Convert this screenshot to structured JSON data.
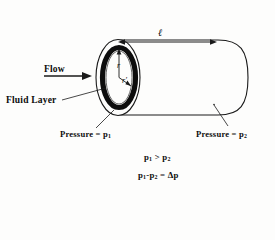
{
  "figure": {
    "type": "fluid-flow-in-cylindrical-pipe-diagram",
    "title_visible": false,
    "background_color": "#fdfdfc",
    "ink_color": "#0d0d0d",
    "fluid_layer_color": "#0d0d0d"
  },
  "labels": {
    "flow": "Flow",
    "fluid_layer": "Fluid Layer",
    "length": "ℓ",
    "radius_outer": "r",
    "radius_inner": "r′",
    "pressure_left_text": "Pressure = p",
    "pressure_left_sub": "1",
    "pressure_right_text": "Pressure = p",
    "pressure_right_sub": "2"
  },
  "equations": {
    "inequality": {
      "lhs": "p",
      "lhs_sub": "1",
      "operator": ">",
      "rhs": "p",
      "rhs_sub": "2"
    },
    "difference": {
      "term1": "p",
      "term1_sub": "1",
      "minus": "-",
      "term2": "p",
      "term2_sub": "2",
      "equals": "=",
      "result": "Δp"
    }
  },
  "icons": {
    "flow_arrow": "arrow-right-icon",
    "length_dimension": "double-headed-arrow-icon",
    "leader_line": "leader-line-icon"
  }
}
